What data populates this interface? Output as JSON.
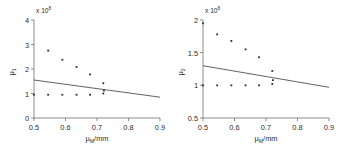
{
  "figure": {
    "background": "#ffffff",
    "point_color": "#2b2b2b",
    "line_color": "#3a3a3a",
    "axis_color": "#6e6e6e"
  },
  "chart_data": [
    {
      "type": "scatter",
      "title": "",
      "xlabel": "μ_M/mm",
      "xlabel_base": "μ",
      "xlabel_sub": "M",
      "xlabel_unit": "/mm",
      "ylabel": "μ1",
      "ylabel_base": "μ",
      "ylabel_sub": "1",
      "y_exponent_text": "x 10",
      "y_exponent_power": "8",
      "xlim": [
        0.5,
        0.9
      ],
      "ylim": [
        0,
        4
      ],
      "xticks": [
        0.5,
        0.6,
        0.7,
        0.8,
        0.9
      ],
      "xticklabels": [
        "0.5",
        "0.6",
        "0.7",
        "0.8",
        "0.9"
      ],
      "yticks": [
        0,
        1,
        2,
        3,
        4
      ],
      "yticklabels": [
        "0",
        "1",
        "2",
        "3",
        "4"
      ],
      "grid": false,
      "legend": "none",
      "series": [
        {
          "name": "upper-scatter",
          "x": [
            0.545,
            0.59,
            0.635,
            0.678,
            0.72,
            0.722
          ],
          "y": [
            2.75,
            2.38,
            2.08,
            1.78,
            1.42,
            1.12
          ]
        },
        {
          "name": "lower-scatter",
          "x": [
            0.5,
            0.545,
            0.59,
            0.635,
            0.678,
            0.72
          ],
          "y": [
            0.95,
            0.95,
            0.95,
            0.95,
            0.95,
            1.0
          ]
        },
        {
          "name": "trend-line",
          "type": "line",
          "x": [
            0.5,
            0.9
          ],
          "y": [
            1.55,
            0.85
          ]
        }
      ]
    },
    {
      "type": "scatter",
      "title": "",
      "xlabel": "μ_M/mm",
      "xlabel_base": "μ",
      "xlabel_sub": "M",
      "xlabel_unit": "/mm",
      "ylabel": "μ2",
      "ylabel_base": "μ",
      "ylabel_sub": "2",
      "y_exponent_text": "x 10",
      "y_exponent_power": "8",
      "xlim": [
        0.5,
        0.9
      ],
      "ylim": [
        0.5,
        2
      ],
      "xticks": [
        0.5,
        0.6,
        0.7,
        0.8,
        0.9
      ],
      "xticklabels": [
        "0.5",
        "0.6",
        "0.7",
        "0.8",
        "0.9"
      ],
      "yticks": [
        0.5,
        1,
        1.5,
        2
      ],
      "yticklabels": [
        "0.5",
        "1",
        "1.5",
        "2"
      ],
      "grid": false,
      "legend": "none",
      "series": [
        {
          "name": "upper-scatter",
          "x": [
            0.5,
            0.545,
            0.59,
            0.635,
            0.678,
            0.72,
            0.722
          ],
          "y": [
            1.95,
            1.78,
            1.68,
            1.55,
            1.43,
            1.22,
            1.08
          ]
        },
        {
          "name": "lower-scatter",
          "x": [
            0.5,
            0.545,
            0.59,
            0.635,
            0.678,
            0.72
          ],
          "y": [
            1.0,
            1.0,
            1.0,
            1.0,
            1.0,
            1.02
          ]
        },
        {
          "name": "trend-line",
          "type": "line",
          "x": [
            0.5,
            0.9
          ],
          "y": [
            1.3,
            0.97
          ]
        }
      ]
    }
  ]
}
